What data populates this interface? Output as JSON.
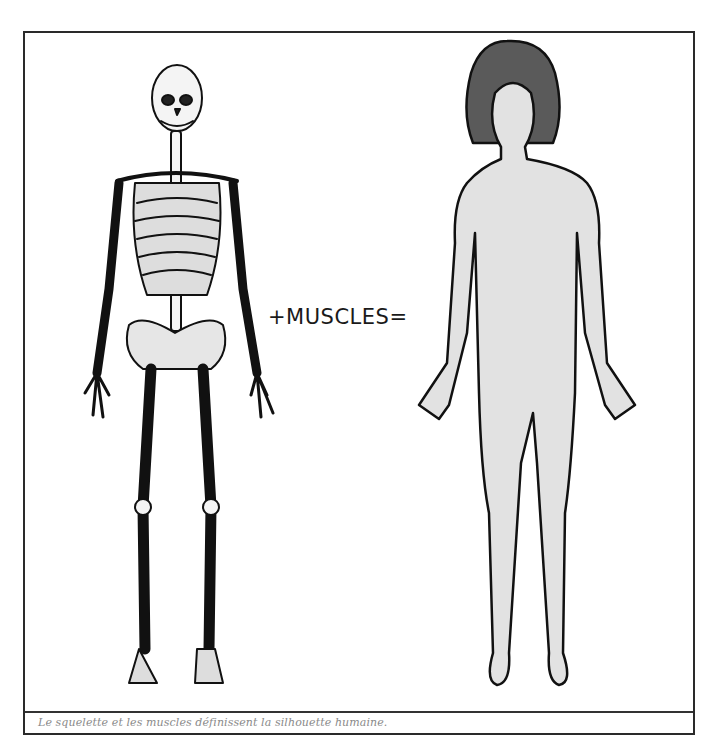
{
  "figure": {
    "equation_label": "+MUSCLES=",
    "caption": "Le squelette et les muscles définissent la silhouette humaine.",
    "left_illustration": "skeleton",
    "right_illustration": "human-silhouette"
  },
  "colors": {
    "frame": "#2a2a2a",
    "caption_text": "#8a8a8a",
    "silhouette_fill": "#e2e2e2",
    "hair_fill": "#5a5a5a",
    "bone_fill": "#f4f4f4",
    "outline": "#111111"
  }
}
